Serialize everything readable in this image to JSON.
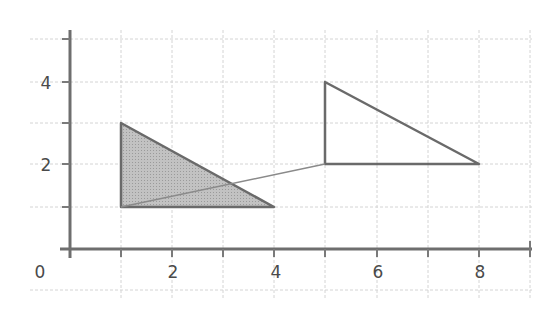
{
  "diagram": {
    "type": "coordinate-grid-transformation",
    "x_axis": {
      "ticks": [
        "0",
        "2",
        "4",
        "6",
        "8"
      ],
      "range": [
        0,
        9
      ]
    },
    "y_axis": {
      "ticks": [
        "2",
        "4"
      ],
      "range": [
        0,
        5
      ]
    },
    "shapes": [
      {
        "name": "shaded-triangle",
        "fill": "#b8b8b8",
        "vertices": [
          [
            1,
            1
          ],
          [
            1,
            3
          ],
          [
            4,
            1
          ]
        ]
      },
      {
        "name": "outline-triangle",
        "fill": "none",
        "vertices": [
          [
            5,
            2
          ],
          [
            5,
            4
          ],
          [
            8,
            2
          ]
        ]
      }
    ],
    "connector": {
      "from": [
        1,
        1
      ],
      "to": [
        5,
        2
      ]
    },
    "colors": {
      "grid": "#cfcfcf",
      "axis": "#6a6a6a",
      "shape_stroke": "#6a6a6a",
      "shade": "#b8b8b8"
    }
  },
  "labels": {
    "x0": "0",
    "x2": "2",
    "x4": "4",
    "x6": "6",
    "x8": "8",
    "y2": "2",
    "y4": "4"
  }
}
